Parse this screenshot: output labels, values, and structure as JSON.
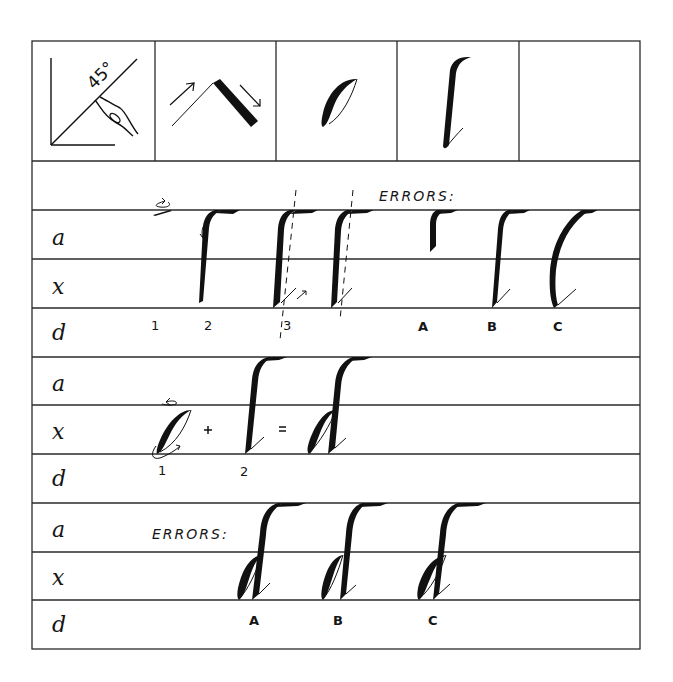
{
  "worksheet": {
    "top_cells": [
      {
        "name": "pen-angle-diagram",
        "label": "45°"
      },
      {
        "name": "stroke-weight-diagram",
        "label": ""
      },
      {
        "name": "o-shape-example",
        "label": ""
      },
      {
        "name": "ascender-stroke-example",
        "label": ""
      },
      {
        "name": "empty-cell",
        "label": ""
      }
    ],
    "guide_labels": {
      "ascender": "a",
      "xheight": "x",
      "descender": "d"
    },
    "section1": {
      "errors_heading": "ERRORS:",
      "step_numbers": [
        "1",
        "2",
        "3"
      ],
      "error_letters": [
        "A",
        "B",
        "C"
      ]
    },
    "section2": {
      "step_numbers": [
        "1",
        "2"
      ],
      "plus": "+",
      "equals": "="
    },
    "section3": {
      "errors_heading": "ERRORS:",
      "error_letters": [
        "A",
        "B",
        "C"
      ]
    }
  }
}
